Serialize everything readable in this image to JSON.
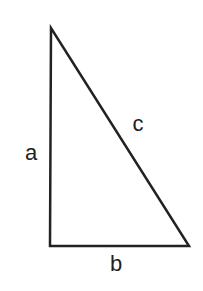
{
  "diagram": {
    "type": "right-triangle",
    "stroke_color": "#222222",
    "background": "#ffffff",
    "vertices": {
      "top": [
        51,
        28
      ],
      "bottom_left": [
        50,
        246
      ],
      "bottom_right": [
        189,
        246
      ]
    },
    "sides": [
      {
        "id": "a",
        "label": "a",
        "description": "vertical leg",
        "label_pos": [
          31,
          153
        ]
      },
      {
        "id": "b",
        "label": "b",
        "description": "horizontal leg (base)",
        "label_pos": [
          116,
          264
        ]
      },
      {
        "id": "c",
        "label": "c",
        "description": "hypotenuse",
        "label_pos": [
          138,
          124
        ]
      }
    ]
  }
}
